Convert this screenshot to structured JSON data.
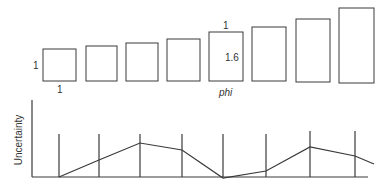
{
  "top_panel": {
    "rectangles": [
      {
        "x": 43,
        "y": 49,
        "w": 33,
        "h": 32
      },
      {
        "x": 86,
        "y": 46,
        "w": 31,
        "h": 35
      },
      {
        "x": 126,
        "y": 43,
        "w": 32,
        "h": 38
      },
      {
        "x": 167,
        "y": 39,
        "w": 33,
        "h": 42
      },
      {
        "x": 209,
        "y": 32,
        "w": 34,
        "h": 49
      },
      {
        "x": 252,
        "y": 27,
        "w": 34,
        "h": 54
      },
      {
        "x": 296,
        "y": 19,
        "w": 34,
        "h": 63
      },
      {
        "x": 339,
        "y": 8,
        "w": 35,
        "h": 75
      }
    ],
    "labels": {
      "first_height": "1",
      "first_width": "1",
      "golden_width": "1",
      "golden_height": "1.6",
      "golden_name": "phi"
    }
  },
  "bottom_panel": {
    "ylabel": "Uncertainty",
    "verticals_x": [
      59,
      99,
      140,
      182,
      223,
      266,
      310,
      355
    ],
    "polyline": [
      [
        59,
        177
      ],
      [
        99,
        160
      ],
      [
        140,
        143
      ],
      [
        182,
        150
      ],
      [
        223,
        178
      ],
      [
        266,
        171
      ],
      [
        310,
        147
      ],
      [
        355,
        156
      ],
      [
        374,
        164
      ]
    ]
  }
}
